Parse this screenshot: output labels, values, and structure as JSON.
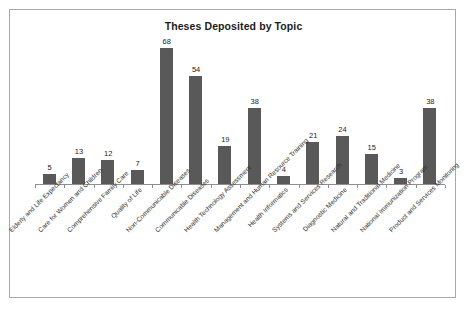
{
  "chart_data": {
    "type": "bar",
    "title": "Theses Deposited by Topic",
    "xlabel": "",
    "ylabel": "",
    "ylim": [
      0,
      72
    ],
    "grid": false,
    "legend": null,
    "orientation": "vertical",
    "bar_color": "#595959",
    "data_labels": true,
    "categories": [
      "Elderly and Life Expectancy",
      "Care for Women and Children",
      "Comprehensive Family Care",
      "Quality of Life",
      "Non-Communicable Diseases",
      "Communicable Diseases",
      "Health Technology Assessment",
      "Management and Human Resource Training",
      "Health Informatics",
      "Systems and Services Research",
      "Diagnostic Medicine",
      "Natural and Traditional Medicine",
      "National Immunization Program",
      "Product and Services Monitoring"
    ],
    "values": [
      5,
      13,
      12,
      7,
      68,
      54,
      19,
      38,
      4,
      21,
      24,
      15,
      3,
      38
    ]
  },
  "figure": {
    "frame_color": "#a9a9ad",
    "background": "#ffffff",
    "axis_color": "#8d8d92"
  }
}
